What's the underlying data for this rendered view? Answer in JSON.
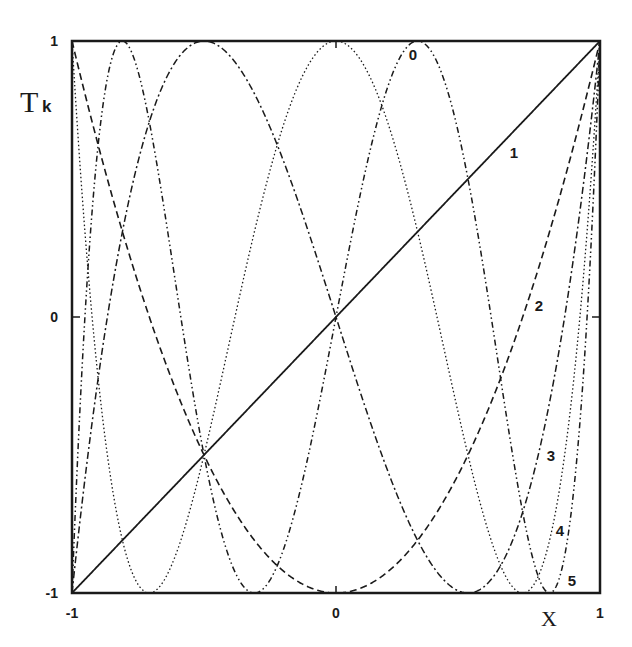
{
  "chart_data": {
    "type": "line",
    "title": "",
    "xlabel": "X",
    "ylabel": "T",
    "ylabel_subscript": "k",
    "xlim": [
      -1,
      1
    ],
    "ylim": [
      -1,
      1
    ],
    "grid": false,
    "legend": "inline curve labels",
    "x_ticks": [
      {
        "value": -1,
        "label": "-1"
      },
      {
        "value": 0,
        "label": "0"
      },
      {
        "value": 1,
        "label": "1"
      }
    ],
    "y_ticks": [
      {
        "value": -1,
        "label": "-1"
      },
      {
        "value": 0,
        "label": "0"
      },
      {
        "value": 1,
        "label": "1"
      }
    ],
    "series": [
      {
        "name": "T0",
        "k": 0,
        "label": "0",
        "formula": "cos(0*acos(x))",
        "style": "solid",
        "label_pos": [
          413,
          60
        ]
      },
      {
        "name": "T1",
        "k": 1,
        "label": "1",
        "formula": "x",
        "style": "solid",
        "label_pos": [
          514,
          158
        ]
      },
      {
        "name": "T2",
        "k": 2,
        "label": "2",
        "formula": "2x^2-1",
        "style": "dashed",
        "label_pos": [
          539,
          311
        ]
      },
      {
        "name": "T3",
        "k": 3,
        "label": "3",
        "formula": "4x^3-3x",
        "style": "dashdot",
        "label_pos": [
          551,
          461
        ]
      },
      {
        "name": "T4",
        "k": 4,
        "label": "4",
        "formula": "8x^4-8x^2+1",
        "style": "dotted",
        "label_pos": [
          560,
          536
        ]
      },
      {
        "name": "T5",
        "k": 5,
        "label": "5",
        "formula": "16x^5-20x^3+5x",
        "style": "dashdotdot",
        "label_pos": [
          572,
          586
        ]
      }
    ],
    "key_points": {
      "T1": [
        [
          -1,
          -1
        ],
        [
          0,
          0
        ],
        [
          1,
          1
        ]
      ],
      "T2": [
        [
          -1,
          1
        ],
        [
          0,
          -1
        ],
        [
          1,
          1
        ]
      ],
      "T3": [
        [
          -1,
          -1
        ],
        [
          -0.5,
          1
        ],
        [
          0.5,
          -1
        ],
        [
          1,
          1
        ]
      ],
      "T4": [
        [
          -1,
          1
        ],
        [
          -0.707,
          -1
        ],
        [
          0,
          1
        ],
        [
          0.707,
          -1
        ],
        [
          1,
          1
        ]
      ],
      "T5": [
        [
          -1,
          -1
        ],
        [
          -0.809,
          1
        ],
        [
          -0.309,
          -1
        ],
        [
          0.309,
          1
        ],
        [
          0.809,
          -1
        ],
        [
          1,
          1
        ]
      ]
    }
  },
  "plot_area": {
    "left": 72,
    "top": 41,
    "right": 600,
    "bottom": 593
  },
  "colors": {
    "ink": "#1a1a1a",
    "background": "#ffffff"
  }
}
